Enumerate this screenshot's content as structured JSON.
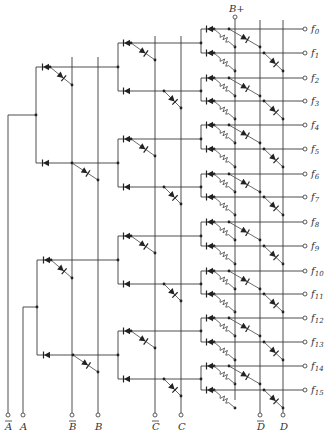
{
  "supply": {
    "label": "B+",
    "x": 235,
    "terminal_y": 17
  },
  "inputs": [
    {
      "label": "A",
      "bar": true,
      "x": 8
    },
    {
      "label": "A",
      "bar": false,
      "x": 23
    },
    {
      "label": "B",
      "bar": true,
      "x": 72
    },
    {
      "label": "B",
      "bar": false,
      "x": 98
    },
    {
      "label": "C",
      "bar": true,
      "x": 155
    },
    {
      "label": "C",
      "bar": false,
      "x": 181
    },
    {
      "label": "D",
      "bar": true,
      "x": 260
    },
    {
      "label": "D",
      "bar": false,
      "x": 283
    }
  ],
  "outputs": [
    {
      "label": "f",
      "sub": "0",
      "y": 29
    },
    {
      "label": "f",
      "sub": "1",
      "y": 53
    },
    {
      "label": "f",
      "sub": "2",
      "y": 78
    },
    {
      "label": "f",
      "sub": "3",
      "y": 101
    },
    {
      "label": "f",
      "sub": "4",
      "y": 125
    },
    {
      "label": "f",
      "sub": "5",
      "y": 149
    },
    {
      "label": "f",
      "sub": "6",
      "y": 174
    },
    {
      "label": "f",
      "sub": "7",
      "y": 197
    },
    {
      "label": "f",
      "sub": "8",
      "y": 222
    },
    {
      "label": "f",
      "sub": "9",
      "y": 246
    },
    {
      "label": "f",
      "sub": "10",
      "y": 271
    },
    {
      "label": "f",
      "sub": "11",
      "y": 294
    },
    {
      "label": "f",
      "sub": "12",
      "y": 318
    },
    {
      "label": "f",
      "sub": "13",
      "y": 342
    },
    {
      "label": "f",
      "sub": "14",
      "y": 366
    },
    {
      "label": "f",
      "sub": "15",
      "y": 390
    }
  ],
  "layout": {
    "bottom_terminal_y": 415,
    "bottom_label_y": 430,
    "output_terminal_x": 305,
    "output_label_x": 311,
    "level1": [
      {
        "input_x": 8,
        "node": [
          36,
          115
        ],
        "branches": [
          67,
          163
        ]
      },
      {
        "input_x": 23,
        "node": [
          37,
          307
        ],
        "branches": [
          260,
          355
        ]
      }
    ],
    "level2_x": 118,
    "level3_x": 201
  }
}
